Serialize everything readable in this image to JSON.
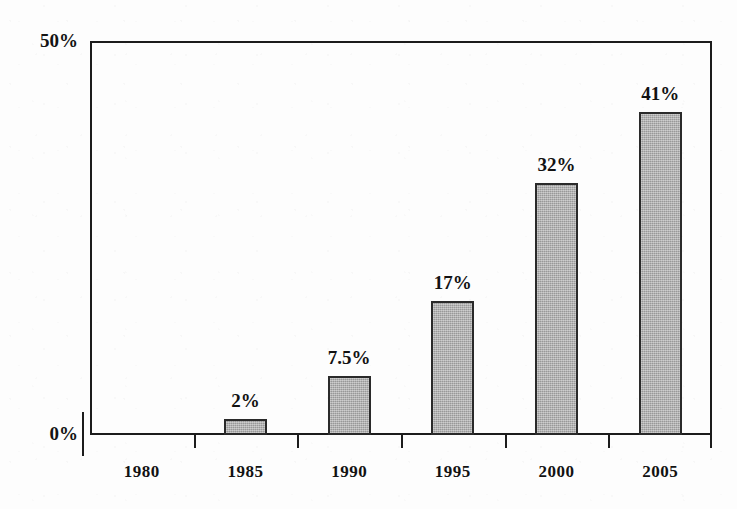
{
  "chart_data": {
    "type": "bar",
    "title": "",
    "xlabel": "",
    "ylabel": "",
    "categories": [
      "1980",
      "1985",
      "1990",
      "1995",
      "2000",
      "2005"
    ],
    "values": [
      0,
      2,
      7.5,
      17,
      32,
      41
    ],
    "value_labels": [
      "",
      "2%",
      "7.5%",
      "17%",
      "32%",
      "41%"
    ],
    "ylim": [
      0,
      50
    ],
    "y_tick_labels": [
      "0%",
      "50%"
    ],
    "grid": false,
    "legend": "none",
    "bar_color": "#a9a9a9",
    "bar_border_color": "#2a2a2a",
    "axis_color": "#1c1c1c",
    "text_color": "#121212",
    "background_color": "#fdfdfd"
  },
  "axes": {
    "y_top_label": "50%",
    "y_zero_label": "0%"
  }
}
